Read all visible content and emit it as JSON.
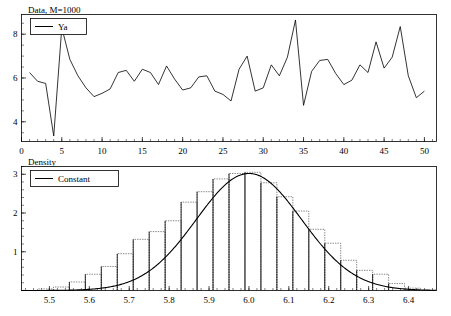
{
  "figure": {
    "width": 451,
    "height": 316,
    "background": "#ffffff",
    "line_color": "#000000",
    "bar_color": "#555555"
  },
  "panels": [
    {
      "id": "data-panel",
      "title": "Data, M=1000",
      "legend": [
        {
          "label": "Ya",
          "marker": "line"
        }
      ]
    },
    {
      "id": "density-panel",
      "title": "Density",
      "legend": [
        {
          "label": "Constant",
          "marker": "line"
        }
      ]
    }
  ],
  "chart_data": [
    {
      "type": "line",
      "id": "data-panel",
      "title": "Data, M=1000",
      "xlabel": "",
      "ylabel": "",
      "xlim": [
        0,
        51.5
      ],
      "ylim": [
        3.1,
        8.9
      ],
      "grid": false,
      "legend_position": "top-left",
      "xticks": [
        0,
        5,
        10,
        15,
        20,
        25,
        30,
        35,
        40,
        45,
        50
      ],
      "xtick_labels": [
        "0",
        "5",
        "10",
        "15",
        "20",
        "25",
        "30",
        "35",
        "40",
        "45",
        "50"
      ],
      "xtick_minor_step": 1,
      "yticks": [
        4,
        6,
        8
      ],
      "ytick_labels": [
        "4",
        "6",
        "8"
      ],
      "ytick_minor_step": 0.5,
      "series": [
        {
          "name": "Ya",
          "x": [
            1,
            2,
            3,
            4,
            5,
            6,
            7,
            8,
            9,
            10,
            11,
            12,
            13,
            14,
            15,
            16,
            17,
            18,
            19,
            20,
            21,
            22,
            23,
            24,
            25,
            26,
            27,
            28,
            29,
            30,
            31,
            32,
            33,
            34,
            35,
            36,
            37,
            38,
            39,
            40,
            41,
            42,
            43,
            44,
            45,
            46,
            47,
            48,
            49,
            50
          ],
          "values": [
            6.25,
            5.85,
            5.75,
            3.35,
            8.3,
            6.85,
            6.1,
            5.55,
            5.15,
            5.3,
            5.5,
            6.25,
            6.35,
            5.85,
            6.4,
            6.25,
            5.7,
            6.55,
            5.95,
            5.45,
            5.55,
            6.05,
            6.1,
            5.4,
            5.25,
            4.95,
            6.4,
            7.0,
            5.4,
            5.55,
            6.6,
            6.1,
            6.95,
            8.65,
            4.75,
            6.3,
            6.8,
            6.85,
            6.2,
            5.7,
            5.9,
            6.6,
            6.25,
            7.65,
            6.45,
            6.95,
            8.35,
            6.1,
            5.1,
            5.4
          ]
        }
      ]
    },
    {
      "type": "histogram",
      "id": "density-panel",
      "title": "Density",
      "xlabel": "",
      "ylabel": "",
      "xlim": [
        5.43,
        6.47
      ],
      "ylim": [
        0,
        3.2
      ],
      "grid": false,
      "legend_position": "top-left",
      "xticks": [
        5.5,
        5.6,
        5.7,
        5.8,
        5.9,
        6.0,
        6.1,
        6.2,
        6.3,
        6.4
      ],
      "xtick_labels": [
        "5.5",
        "5.6",
        "5.7",
        "5.8",
        "5.9",
        "6.0",
        "6.1",
        "6.2",
        "6.3",
        "6.4"
      ],
      "xtick_minor_step": 0.02,
      "yticks": [
        1,
        2,
        3
      ],
      "ytick_labels": [
        "1",
        "2",
        "3"
      ],
      "ytick_minor_step": 0.2,
      "bin_width": 0.04,
      "bin_left_edges": [
        5.47,
        5.51,
        5.55,
        5.59,
        5.63,
        5.67,
        5.71,
        5.75,
        5.79,
        5.83,
        5.87,
        5.91,
        5.95,
        5.99,
        6.03,
        6.07,
        6.11,
        6.15,
        6.19,
        6.23,
        6.27,
        6.31,
        6.35,
        6.39
      ],
      "bin_heights": [
        0.04,
        0.09,
        0.22,
        0.42,
        0.62,
        0.95,
        1.32,
        1.52,
        1.8,
        2.28,
        2.55,
        2.88,
        3.02,
        3.05,
        2.78,
        2.42,
        2.05,
        1.58,
        1.22,
        0.78,
        0.52,
        0.42,
        0.18,
        0.06
      ],
      "curves": [
        {
          "name": "Constant",
          "type": "normal-density",
          "mean": 6.0,
          "sigma": 0.132,
          "peak": 3.02
        }
      ]
    }
  ]
}
